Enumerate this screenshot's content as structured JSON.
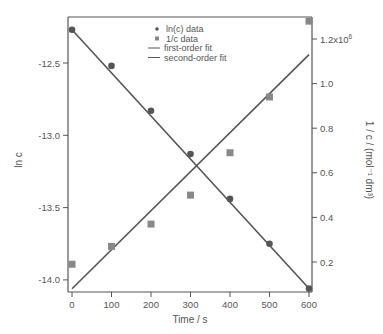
{
  "chart_data": {
    "type": "scatter",
    "title": "",
    "xlabel": "Time / s",
    "ylabel_left": "ln c",
    "ylabel_right": "1 / c / (mol⁻¹ dm³)",
    "xlim": [
      -10,
      610
    ],
    "ylim_left": [
      -14.08,
      -12.21
    ],
    "ylim_right": [
      0.1,
      1.33
    ],
    "x_ticks": [
      "0",
      "100",
      "200",
      "300",
      "400",
      "500",
      "600"
    ],
    "left_ticks": [
      "-12.5",
      "-13.0",
      "-13.5",
      "-14.0"
    ],
    "right_ticks": [
      "0.2",
      "0.4",
      "0.6",
      "0.8",
      "1.0",
      "1.2x10⁶"
    ],
    "grid": false,
    "legend_position": "top-center-inside",
    "series": [
      {
        "name": "ln(c) data",
        "marker": "circle",
        "axis": "left",
        "x": [
          0,
          100,
          200,
          300,
          400,
          500,
          600
        ],
        "y": [
          -12.27,
          -12.52,
          -12.83,
          -13.13,
          -13.44,
          -13.75,
          -14.06
        ]
      },
      {
        "name": "1/c data",
        "marker": "square",
        "axis": "right",
        "x": [
          0,
          100,
          200,
          300,
          400,
          500,
          600
        ],
        "y": [
          0.19,
          0.27,
          0.37,
          0.5,
          0.69,
          0.94,
          1.28
        ]
      },
      {
        "name": "first-order fit",
        "marker": "line",
        "axis": "left",
        "x": [
          0,
          600
        ],
        "y": [
          -12.27,
          -14.06
        ]
      },
      {
        "name": "second-order fit",
        "marker": "line",
        "axis": "right",
        "x": [
          0,
          600
        ],
        "y": [
          0.08,
          1.13
        ]
      }
    ],
    "colors": {
      "axis": "#555555",
      "circle": "#555555",
      "square": "#888888",
      "line": "#555555"
    }
  }
}
